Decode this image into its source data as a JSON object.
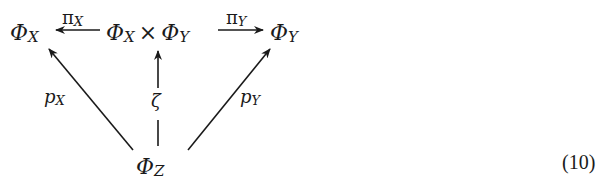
{
  "diagram": {
    "type": "commutative-diagram",
    "nodes": {
      "phi_x": {
        "symbol": "Φ",
        "sub": "X"
      },
      "product": {
        "left_symbol": "Φ",
        "left_sub": "X",
        "operator": "×",
        "right_symbol": "Φ",
        "right_sub": "Y"
      },
      "phi_y": {
        "symbol": "Φ",
        "sub": "Y"
      },
      "phi_z": {
        "symbol": "Φ",
        "sub": "Z"
      }
    },
    "arrows": {
      "pi_x": {
        "from": "product",
        "to": "phi_x",
        "symbol": "π",
        "sub": "X"
      },
      "pi_y": {
        "from": "product",
        "to": "phi_y",
        "symbol": "π",
        "sub": "Y"
      },
      "p_x": {
        "from": "phi_z",
        "to": "phi_x",
        "symbol": "p",
        "sub": "X"
      },
      "zeta": {
        "from": "phi_z",
        "to": "product",
        "symbol": "ζ",
        "style": "dashed"
      },
      "p_y": {
        "from": "phi_z",
        "to": "phi_y",
        "symbol": "p",
        "sub": "Y"
      }
    },
    "equation_number": "(10)",
    "colors": {
      "ink": "#1a1a1a",
      "background": "#ffffff"
    }
  }
}
